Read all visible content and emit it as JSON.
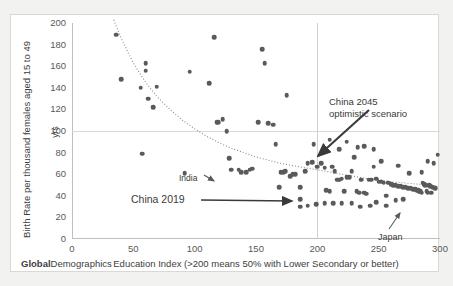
{
  "brand": {
    "bold_part": "Global",
    "rest_part": "Demographics"
  },
  "chart_data": {
    "type": "scatter",
    "title": "",
    "xlabel": "Education Index (>200 means 50% with Lower Secondary or better)",
    "ylabel": "Birth Rate per thousand females aged 15 to 49",
    "ylabel_unit": "yrs",
    "xlim": [
      0,
      300
    ],
    "ylim": [
      0,
      200
    ],
    "xticks": [
      0,
      50,
      100,
      150,
      200,
      250,
      300
    ],
    "yticks": [
      0,
      20,
      40,
      60,
      80,
      100,
      120,
      140,
      160,
      180,
      200
    ],
    "grid": "reference-lines-only",
    "reference_lines": {
      "horizontal_y": 100,
      "vertical_x": 200
    },
    "legend": "none",
    "marker_color": "#5a5a5a",
    "trendline": {
      "style": "dotted",
      "color": "#8a8a8a",
      "description": "power/exponential decay fit through cloud",
      "points": [
        [
          34,
          203
        ],
        [
          40,
          186
        ],
        [
          50,
          163
        ],
        [
          60,
          145
        ],
        [
          70,
          131
        ],
        [
          80,
          120
        ],
        [
          90,
          110
        ],
        [
          100,
          102
        ],
        [
          110,
          95
        ],
        [
          120,
          89
        ],
        [
          130,
          84
        ],
        [
          140,
          80
        ],
        [
          150,
          76
        ],
        [
          160,
          73
        ],
        [
          170,
          70
        ],
        [
          180,
          68
        ],
        [
          190,
          66
        ],
        [
          200,
          64
        ],
        [
          210,
          62
        ],
        [
          220,
          60
        ],
        [
          230,
          58
        ],
        [
          240,
          56
        ],
        [
          250,
          55
        ],
        [
          260,
          53
        ],
        [
          270,
          52
        ],
        [
          280,
          51
        ],
        [
          290,
          50
        ],
        [
          298,
          49
        ]
      ]
    },
    "annotations": [
      {
        "name": "china-2045",
        "text_line1": "China 2045",
        "text_line2": "optimistic scenario",
        "points_to_x": 228,
        "points_to_y": 63
      },
      {
        "name": "india",
        "text": "India",
        "points_to_x": 136,
        "points_to_y": 64
      },
      {
        "name": "china-2019",
        "text": "China 2019",
        "points_to_x": 187,
        "points_to_y": 48
      },
      {
        "name": "japan",
        "text": "Japan",
        "points_to_x": 282,
        "points_to_y": 37
      }
    ],
    "points": [
      [
        36,
        189
      ],
      [
        40,
        148
      ],
      [
        56,
        140
      ],
      [
        57,
        79
      ],
      [
        60,
        163
      ],
      [
        60,
        156
      ],
      [
        62,
        130
      ],
      [
        66,
        122
      ],
      [
        69,
        141
      ],
      [
        92,
        61
      ],
      [
        96,
        155
      ],
      [
        112,
        144
      ],
      [
        116,
        187
      ],
      [
        118,
        108
      ],
      [
        119,
        108
      ],
      [
        123,
        111
      ],
      [
        126,
        100
      ],
      [
        128,
        75
      ],
      [
        130,
        64
      ],
      [
        136,
        64
      ],
      [
        138,
        62
      ],
      [
        142,
        62
      ],
      [
        145,
        64
      ],
      [
        147,
        65
      ],
      [
        152,
        108
      ],
      [
        155,
        176
      ],
      [
        157,
        163
      ],
      [
        160,
        107
      ],
      [
        164,
        106
      ],
      [
        166,
        88
      ],
      [
        169,
        48
      ],
      [
        170,
        62
      ],
      [
        172,
        62
      ],
      [
        174,
        63
      ],
      [
        175,
        133
      ],
      [
        178,
        58
      ],
      [
        180,
        60
      ],
      [
        182,
        60
      ],
      [
        186,
        48
      ],
      [
        186,
        37
      ],
      [
        190,
        63
      ],
      [
        192,
        70
      ],
      [
        196,
        71
      ],
      [
        200,
        67
      ],
      [
        203,
        70
      ],
      [
        206,
        66
      ],
      [
        207,
        45
      ],
      [
        210,
        44
      ],
      [
        212,
        67
      ],
      [
        214,
        63
      ],
      [
        216,
        55
      ],
      [
        218,
        55
      ],
      [
        220,
        56
      ],
      [
        222,
        44
      ],
      [
        224,
        57
      ],
      [
        226,
        57
      ],
      [
        228,
        63
      ],
      [
        230,
        76
      ],
      [
        232,
        44
      ],
      [
        234,
        43
      ],
      [
        236,
        55
      ],
      [
        238,
        43
      ],
      [
        240,
        42
      ],
      [
        242,
        55
      ],
      [
        244,
        55
      ],
      [
        246,
        67
      ],
      [
        248,
        56
      ],
      [
        250,
        53
      ],
      [
        252,
        53
      ],
      [
        254,
        52
      ],
      [
        256,
        40
      ],
      [
        258,
        52
      ],
      [
        260,
        51
      ],
      [
        262,
        50
      ],
      [
        264,
        50
      ],
      [
        266,
        49
      ],
      [
        268,
        49
      ],
      [
        270,
        48
      ],
      [
        272,
        48
      ],
      [
        274,
        47
      ],
      [
        276,
        47
      ],
      [
        278,
        46
      ],
      [
        280,
        46
      ],
      [
        281,
        45
      ],
      [
        282,
        45
      ],
      [
        283,
        44
      ],
      [
        284,
        44
      ],
      [
        285,
        43
      ],
      [
        286,
        52
      ],
      [
        287,
        51
      ],
      [
        288,
        50
      ],
      [
        289,
        44
      ],
      [
        290,
        43
      ],
      [
        291,
        50
      ],
      [
        292,
        49
      ],
      [
        293,
        43
      ],
      [
        294,
        48
      ],
      [
        296,
        47
      ],
      [
        298,
        78
      ],
      [
        295,
        70
      ],
      [
        290,
        72
      ],
      [
        285,
        62
      ],
      [
        275,
        61
      ],
      [
        270,
        37
      ],
      [
        264,
        36
      ],
      [
        256,
        31
      ],
      [
        248,
        34
      ],
      [
        243,
        31
      ],
      [
        235,
        30
      ],
      [
        228,
        33
      ],
      [
        220,
        33
      ],
      [
        213,
        33
      ],
      [
        206,
        33
      ],
      [
        199,
        32
      ],
      [
        192,
        31
      ],
      [
        186,
        30
      ],
      [
        210,
        92
      ],
      [
        224,
        90
      ],
      [
        238,
        86
      ],
      [
        252,
        72
      ],
      [
        266,
        68
      ],
      [
        246,
        83
      ],
      [
        233,
        85
      ],
      [
        218,
        83
      ],
      [
        205,
        82
      ],
      [
        197,
        88
      ]
    ]
  }
}
